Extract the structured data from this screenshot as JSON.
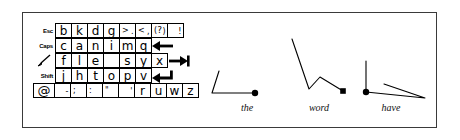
{
  "figure": {
    "background": "#ffffff",
    "frame_color": "#3a3a3a",
    "ink_color": "#000000"
  },
  "keyboard": {
    "name": "gesture-keyboard-layout",
    "rows": [
      {
        "id": "row-1",
        "modifier": "Esc",
        "keys": [
          {
            "type": "letter",
            "label": "b"
          },
          {
            "type": "letter",
            "label": "k"
          },
          {
            "type": "letter",
            "label": "d"
          },
          {
            "type": "letter",
            "label": "g"
          },
          {
            "type": "punct",
            "hi": ">",
            "lo": "."
          },
          {
            "type": "punct",
            "hi": "<",
            "lo": ","
          },
          {
            "type": "punct",
            "hi": "(",
            "center": "?",
            "lo": ")"
          },
          {
            "type": "punct",
            "lo": "!"
          }
        ],
        "action": ""
      },
      {
        "id": "row-2",
        "modifier": "Caps",
        "keys": [
          {
            "type": "letter",
            "label": "c"
          },
          {
            "type": "letter",
            "label": "a"
          },
          {
            "type": "letter",
            "label": "n"
          },
          {
            "type": "letter",
            "label": "i"
          },
          {
            "type": "letter",
            "label": "m"
          },
          {
            "type": "letter",
            "label": "q"
          }
        ],
        "action": "backspace-arrow"
      },
      {
        "id": "row-3",
        "modifier": "pen-stroke-icon",
        "keys": [
          {
            "type": "letter",
            "label": "f"
          },
          {
            "type": "letter",
            "label": "l"
          },
          {
            "type": "letter",
            "label": "e"
          },
          {
            "type": "letter",
            "label": ""
          },
          {
            "type": "letter",
            "label": "s"
          },
          {
            "type": "letter",
            "label": "y"
          },
          {
            "type": "letter",
            "label": "x"
          }
        ],
        "action": "tab-arrow"
      },
      {
        "id": "row-4",
        "modifier": "Shift",
        "keys": [
          {
            "type": "letter",
            "label": "j"
          },
          {
            "type": "letter",
            "label": "h"
          },
          {
            "type": "letter",
            "label": "t"
          },
          {
            "type": "letter",
            "label": "o"
          },
          {
            "type": "letter",
            "label": "p"
          },
          {
            "type": "letter",
            "label": "v"
          }
        ],
        "action": "enter-arrow"
      },
      {
        "id": "row-5",
        "modifier": "at-key",
        "keys": [
          {
            "type": "punct",
            "lo": "-"
          },
          {
            "type": "punct",
            "hi": ";"
          },
          {
            "type": "punct",
            "hi": ":"
          },
          {
            "type": "punct",
            "hi": "\""
          },
          {
            "type": "punct",
            "lo": "'"
          },
          {
            "type": "letter",
            "label": "r"
          },
          {
            "type": "letter",
            "label": "u"
          },
          {
            "type": "letter",
            "label": "w"
          },
          {
            "type": "letter",
            "label": "z"
          }
        ],
        "action": ""
      }
    ],
    "at_symbol": "@"
  },
  "gestures": [
    {
      "id": "gesture-the",
      "label": "the",
      "polyline": "10,52 3,74 46,74",
      "start_dot": {
        "x": 46,
        "y": 74,
        "shape": "circle"
      }
    },
    {
      "id": "gesture-word",
      "label": "word",
      "polyline": "11,20 28,70 39,58 62,72",
      "start_dot": {
        "x": 62,
        "y": 72,
        "shape": "square"
      }
    },
    {
      "id": "gesture-have",
      "label": "have",
      "polyline": "11,42 11,73 70,79 29,65",
      "start_dot": {
        "x": 11,
        "y": 73,
        "shape": "circle"
      }
    }
  ]
}
